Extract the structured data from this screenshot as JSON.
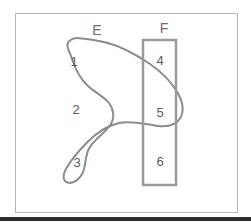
{
  "figure": {
    "background_color": "#ffffff",
    "frame": {
      "stroke_color": "#b8b8b8",
      "x": 15,
      "y": 13,
      "width": 222,
      "height": 199
    },
    "bottom_bar": {
      "color": "#2b2b2b",
      "y": 217,
      "height": 4
    }
  },
  "sets": {
    "E": {
      "label": "E",
      "label_x": 97,
      "label_y": 31,
      "stroke_color": "#8c8c8c",
      "shape": "blob"
    },
    "F": {
      "label": "F",
      "label_x": 164,
      "label_y": 29,
      "stroke_color": "#9a9a9a",
      "shape": "rectangle",
      "rect": {
        "x": 143,
        "y": 40,
        "width": 33,
        "height": 145
      }
    }
  },
  "regions": [
    {
      "id": "region-1",
      "label": "1",
      "x": 74,
      "y": 63,
      "description": "upper area inside E only"
    },
    {
      "id": "region-2",
      "label": "2",
      "x": 76,
      "y": 111,
      "description": "middle area inside E only"
    },
    {
      "id": "region-3",
      "label": "3",
      "x": 77,
      "y": 164,
      "description": "lower area inside E only"
    },
    {
      "id": "region-4",
      "label": "4",
      "x": 160,
      "y": 62,
      "description": "upper area inside F only"
    },
    {
      "id": "region-5",
      "label": "5",
      "x": 160,
      "y": 114,
      "description": "overlap of E and F"
    },
    {
      "id": "region-6",
      "label": "6",
      "x": 160,
      "y": 163,
      "description": "lower area inside F only"
    }
  ],
  "paths": {
    "blob_outline": "M 67.5 46.5 C 66.5 41.5 72 37.5 79 38.2 C 88 39.0 97 40.2 106 42.5 C 121 46.3 136 54.5 150 64.0 C 162 72.3 172 82.5 178 93.5 C 183 102.5 184 112.0 180 118.5 C 176 125.0 167 127.0 158 126.0 C 146 124.6 132 120.0 119 123.0 C 108 125.5 97 132.5 88 141.5 C 79 150.5 71 160.0 66.5 168.0 C 62.5 175.0 62.5 181.0 67.5 182.5 C 73 184.2 80 179.5 83 172.0 C 86 164.5 85 156.0 89 148.5 C 94 139.0 105 133.0 110 125.5 C 115 118.0 114 109.5 109 103.0 C 104 96.5 95 92.5 88 86.0 C 81 79.5 76 70.5 73 61.5 C 70.5 54.2 68.3 50.5 67.5 46.5 Z"
  }
}
